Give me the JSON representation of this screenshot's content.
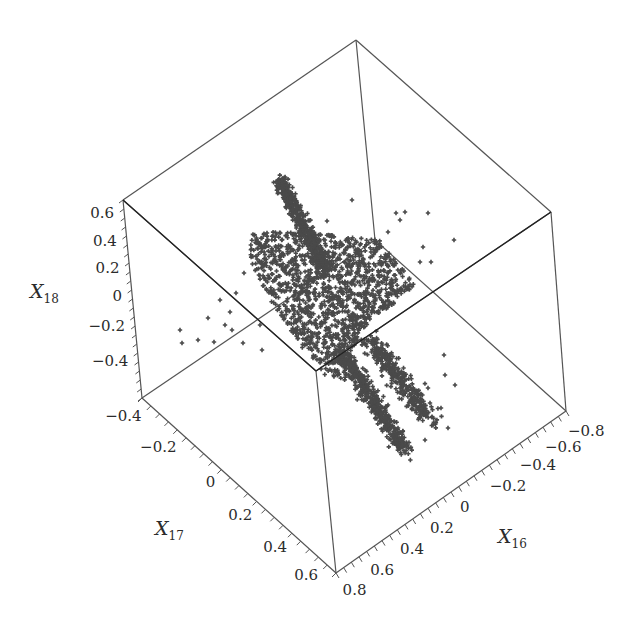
{
  "chart_data": {
    "type": "scatter",
    "dimensions": 3,
    "title": "",
    "marker": "+",
    "marker_color": "#4a4a4a",
    "box_color": "#555555",
    "axes": {
      "x": {
        "label": "X",
        "subscript": "16",
        "ticks": [
          "-0.8",
          "-0.6",
          "-0.4",
          "-0.2",
          "0",
          "0.2",
          "0.4",
          "0.6",
          "0.8"
        ],
        "range": [
          -0.8,
          0.8
        ]
      },
      "y": {
        "label": "X",
        "subscript": "17",
        "ticks": [
          "-0.4",
          "-0.2",
          "0",
          "0.2",
          "0.4",
          "0.6"
        ],
        "range": [
          -0.45,
          0.65
        ]
      },
      "z": {
        "label": "X",
        "subscript": "18",
        "ticks": [
          "0.6",
          "0.4",
          "0.2",
          "0",
          "-0.2",
          "-0.4"
        ],
        "range": [
          -0.5,
          0.65
        ]
      }
    },
    "grid": false,
    "legend": null
  },
  "labels": {
    "x_axis_title": "X",
    "x_axis_sub": "16",
    "y_axis_title": "X",
    "y_axis_sub": "17",
    "z_axis_title": "X",
    "z_axis_sub": "18"
  }
}
